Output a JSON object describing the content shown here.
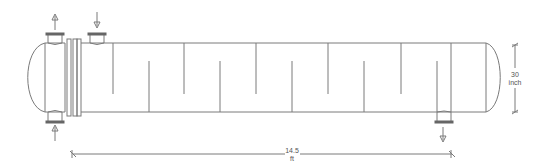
{
  "diagram": {
    "type": "shell-and-tube heat exchanger",
    "colors": {
      "line": "#7a7a7a",
      "dark": "#444444",
      "background": "#ffffff"
    },
    "dimensions": {
      "length": {
        "value": "14.5",
        "unit": "ft"
      },
      "diameter": {
        "value": "30",
        "unit": "inch"
      }
    },
    "nozzles": [
      {
        "id": "tube-outlet",
        "position": "top-left",
        "flow": "up"
      },
      {
        "id": "shell-inlet",
        "position": "top",
        "flow": "down"
      },
      {
        "id": "tube-inlet",
        "position": "bottom-left",
        "flow": "up"
      },
      {
        "id": "shell-outlet",
        "position": "bottom-right",
        "flow": "down"
      }
    ],
    "baffles": {
      "top_hanging_x": [
        113,
        184,
        256,
        328,
        401
      ],
      "bottom_rising_x": [
        149,
        220,
        292,
        364,
        437
      ]
    }
  }
}
